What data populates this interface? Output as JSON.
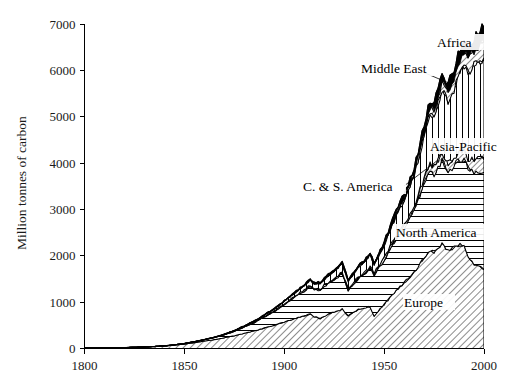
{
  "chart_data": {
    "type": "area",
    "title": "",
    "xlabel": "",
    "ylabel": "Million tonnes of carbon",
    "xlim": [
      1800,
      2000
    ],
    "ylim": [
      0,
      7000
    ],
    "xticks": [
      1800,
      1850,
      1900,
      1950,
      2000
    ],
    "yticks": [
      0,
      1000,
      2000,
      3000,
      4000,
      5000,
      6000,
      7000
    ],
    "grid": false,
    "legend_position": "inline-annotations",
    "stacked": true,
    "x": [
      1800,
      1805,
      1810,
      1815,
      1820,
      1825,
      1830,
      1835,
      1840,
      1845,
      1850,
      1855,
      1860,
      1865,
      1870,
      1875,
      1880,
      1885,
      1890,
      1895,
      1900,
      1905,
      1910,
      1913,
      1915,
      1918,
      1920,
      1925,
      1929,
      1932,
      1935,
      1938,
      1940,
      1943,
      1945,
      1948,
      1950,
      1955,
      1960,
      1965,
      1970,
      1973,
      1975,
      1979,
      1982,
      1985,
      1988,
      1990,
      1992,
      1995,
      1998,
      2000
    ],
    "series": [
      {
        "name": "Europe",
        "pattern": "diagonal-hatch",
        "values": [
          8,
          10,
          13,
          16,
          20,
          25,
          31,
          40,
          52,
          70,
          94,
          125,
          160,
          190,
          230,
          275,
          330,
          380,
          440,
          500,
          570,
          640,
          700,
          740,
          690,
          640,
          700,
          790,
          850,
          700,
          790,
          860,
          880,
          900,
          700,
          860,
          950,
          1200,
          1420,
          1640,
          1950,
          2120,
          2080,
          2250,
          2130,
          2180,
          2230,
          2200,
          1980,
          1830,
          1760,
          1700
        ]
      },
      {
        "name": "North America",
        "pattern": "horizontal-lines",
        "values": [
          0,
          0,
          0,
          1,
          1,
          2,
          3,
          4,
          6,
          9,
          13,
          20,
          30,
          45,
          65,
          95,
          135,
          180,
          240,
          300,
          380,
          460,
          540,
          600,
          580,
          620,
          640,
          700,
          760,
          560,
          620,
          680,
          700,
          820,
          880,
          920,
          940,
          1100,
          1180,
          1330,
          1600,
          1750,
          1680,
          1810,
          1690,
          1760,
          1860,
          1870,
          1900,
          1970,
          2060,
          2100
        ]
      },
      {
        "name": "C. & S. America",
        "pattern": "diagonal-hatch-thin",
        "values": [
          0,
          0,
          0,
          0,
          0,
          0,
          0,
          0,
          0,
          0,
          0,
          1,
          1,
          2,
          3,
          4,
          5,
          7,
          9,
          11,
          14,
          18,
          22,
          25,
          24,
          26,
          28,
          33,
          38,
          33,
          36,
          40,
          42,
          45,
          46,
          52,
          56,
          70,
          85,
          100,
          125,
          145,
          150,
          175,
          175,
          180,
          200,
          210,
          220,
          245,
          270,
          280
        ]
      },
      {
        "name": "Asia-Pacific",
        "pattern": "vertical-lines",
        "values": [
          0,
          0,
          0,
          0,
          0,
          0,
          0,
          0,
          0,
          1,
          1,
          2,
          3,
          5,
          8,
          12,
          17,
          24,
          33,
          44,
          58,
          75,
          95,
          110,
          110,
          118,
          125,
          150,
          175,
          160,
          185,
          215,
          230,
          260,
          180,
          230,
          280,
          390,
          520,
          660,
          900,
          1080,
          1100,
          1320,
          1340,
          1480,
          1700,
          1790,
          1870,
          2050,
          2130,
          2200
        ]
      },
      {
        "name": "Middle East",
        "pattern": "diagonal-hatch",
        "values": [
          0,
          0,
          0,
          0,
          0,
          0,
          0,
          0,
          0,
          0,
          0,
          0,
          0,
          0,
          0,
          0,
          0,
          0,
          0,
          1,
          1,
          2,
          3,
          4,
          4,
          5,
          6,
          8,
          10,
          9,
          11,
          13,
          14,
          16,
          17,
          20,
          24,
          36,
          52,
          72,
          100,
          125,
          135,
          175,
          195,
          215,
          250,
          270,
          290,
          320,
          345,
          360
        ]
      },
      {
        "name": "Africa",
        "pattern": "solid-black",
        "values": [
          0,
          0,
          0,
          0,
          0,
          0,
          0,
          0,
          0,
          0,
          0,
          0,
          1,
          1,
          2,
          2,
          3,
          4,
          5,
          6,
          8,
          10,
          13,
          15,
          15,
          16,
          18,
          22,
          26,
          24,
          26,
          30,
          32,
          36,
          38,
          44,
          48,
          62,
          78,
          96,
          125,
          145,
          155,
          180,
          195,
          210,
          230,
          240,
          250,
          265,
          280,
          290
        ]
      }
    ],
    "totals_note": "Stacked total peaks near 6700 in 2000",
    "annotations": [
      {
        "text": "Africa",
        "series": "Africa"
      },
      {
        "text": "Middle East",
        "series": "Middle East"
      },
      {
        "text": "Asia-Pacific",
        "series": "Asia-Pacific"
      },
      {
        "text": "C. & S. America",
        "series": "C. & S. America"
      },
      {
        "text": "North America",
        "series": "North America"
      },
      {
        "text": "Europe",
        "series": "Europe"
      }
    ],
    "colors": {
      "ink": "#000000",
      "background": "#ffffff",
      "tick_text": "#1a1a1a"
    }
  },
  "labels": {
    "africa": "Africa",
    "middle_east": "Middle East",
    "asia_pacific": "Asia-Pacific",
    "cs_america": "C. & S. America",
    "north_america": "North America",
    "europe": "Europe"
  },
  "axes": {
    "ylabel": "Million tonnes of carbon",
    "yticks": [
      "0",
      "1000",
      "2000",
      "3000",
      "4000",
      "5000",
      "6000",
      "7000"
    ],
    "xticks": [
      "1800",
      "1850",
      "1900",
      "1950",
      "2000"
    ]
  }
}
